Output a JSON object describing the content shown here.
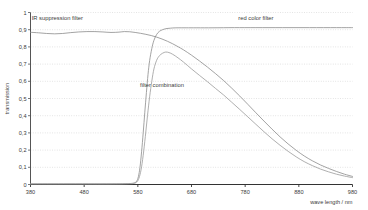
{
  "chart_data": {
    "type": "line",
    "title": "",
    "xlabel": "wave length / nm",
    "ylabel": "transmission",
    "xlim": [
      380,
      980
    ],
    "ylim": [
      0,
      1
    ],
    "grid": "horizontal-dotted",
    "legend_position": "inline-annotations",
    "x_ticks": [
      "380",
      "480",
      "580",
      "680",
      "780",
      "880",
      "980"
    ],
    "y_ticks": [
      "1",
      "0,9",
      "0,8",
      "0,7",
      "0,6",
      "0,5",
      "0,4",
      "0,3",
      "0,2",
      "0,1",
      "0"
    ],
    "annotations": [
      {
        "name": "ir-suppression-filter",
        "text": "IR suppression filter",
        "x": 430,
        "y": 0.955
      },
      {
        "name": "red-color-filter",
        "text": "red color filter",
        "x": 800,
        "y": 0.955
      },
      {
        "name": "filter-combination",
        "text": "filter combination",
        "x": 625,
        "y": 0.565
      }
    ],
    "series": [
      {
        "name": "IR suppression filter",
        "color": "#8c8c8c",
        "x": [
          380,
          395,
          410,
          425,
          440,
          455,
          470,
          485,
          500,
          515,
          530,
          545,
          555,
          565,
          575,
          585,
          595,
          605,
          615,
          625,
          635,
          645,
          655,
          665,
          680,
          695,
          710,
          725,
          740,
          755,
          770,
          785,
          800,
          815,
          830,
          845,
          860,
          875,
          890,
          905,
          920,
          935,
          950,
          965,
          980
        ],
        "y": [
          0.885,
          0.882,
          0.878,
          0.876,
          0.878,
          0.883,
          0.887,
          0.889,
          0.889,
          0.887,
          0.884,
          0.886,
          0.889,
          0.888,
          0.884,
          0.879,
          0.873,
          0.866,
          0.857,
          0.846,
          0.833,
          0.818,
          0.801,
          0.783,
          0.752,
          0.718,
          0.682,
          0.644,
          0.604,
          0.56,
          0.514,
          0.466,
          0.417,
          0.369,
          0.322,
          0.277,
          0.236,
          0.199,
          0.166,
          0.138,
          0.114,
          0.094,
          0.076,
          0.06,
          0.047
        ]
      },
      {
        "name": "red color filter",
        "color": "#8c8c8c",
        "x": [
          380,
          450,
          500,
          540,
          560,
          570,
          575,
          578,
          581,
          584,
          587,
          590,
          593,
          596,
          599,
          602,
          606,
          610,
          615,
          620,
          626,
          632,
          638,
          645,
          655,
          670,
          690,
          720,
          760,
          800,
          850,
          900,
          950,
          980
        ],
        "y": [
          0.004,
          0.004,
          0.004,
          0.004,
          0.005,
          0.007,
          0.011,
          0.02,
          0.045,
          0.1,
          0.19,
          0.3,
          0.42,
          0.535,
          0.64,
          0.72,
          0.79,
          0.838,
          0.872,
          0.89,
          0.9,
          0.906,
          0.908,
          0.91,
          0.911,
          0.911,
          0.911,
          0.911,
          0.912,
          0.912,
          0.912,
          0.912,
          0.912,
          0.912
        ]
      },
      {
        "name": "filter combination",
        "color": "#9a9a9a",
        "x": [
          380,
          450,
          520,
          560,
          572,
          578,
          582,
          586,
          590,
          594,
          598,
          602,
          606,
          610,
          615,
          620,
          626,
          632,
          638,
          645,
          655,
          665,
          680,
          695,
          710,
          725,
          740,
          755,
          770,
          785,
          800,
          815,
          830,
          845,
          860,
          875,
          890,
          905,
          920,
          935,
          950,
          965,
          980
        ],
        "y": [
          0.003,
          0.003,
          0.003,
          0.004,
          0.006,
          0.014,
          0.036,
          0.085,
          0.17,
          0.28,
          0.4,
          0.51,
          0.6,
          0.672,
          0.722,
          0.748,
          0.763,
          0.77,
          0.767,
          0.757,
          0.736,
          0.712,
          0.672,
          0.634,
          0.597,
          0.558,
          0.52,
          0.478,
          0.436,
          0.393,
          0.35,
          0.307,
          0.266,
          0.228,
          0.193,
          0.161,
          0.133,
          0.11,
          0.09,
          0.074,
          0.06,
          0.049,
          0.04
        ]
      }
    ]
  }
}
